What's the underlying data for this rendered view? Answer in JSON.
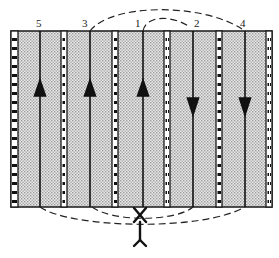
{
  "diagram": {
    "type": "flow-channel schematic",
    "colors": {
      "stroke": "#1a1a1a",
      "fill_pattern": "#b8b8b8",
      "background": "#ffffff"
    },
    "channels": [
      {
        "id": "5",
        "label": "5",
        "x": 40,
        "direction": "up"
      },
      {
        "id": "3",
        "label": "3",
        "x": 90,
        "direction": "up"
      },
      {
        "id": "1",
        "label": "1",
        "x": 143,
        "direction": "up"
      },
      {
        "id": "2",
        "label": "2",
        "x": 193,
        "direction": "down"
      },
      {
        "id": "4",
        "label": "4",
        "x": 245,
        "direction": "down"
      }
    ],
    "top_connections": [
      {
        "from": "1",
        "to": "2"
      },
      {
        "from": "3",
        "to": "4"
      }
    ],
    "bottom_connections": [
      {
        "from": "5",
        "to": "inlet"
      },
      {
        "from": "3",
        "to": "inlet"
      },
      {
        "from": "inlet",
        "to": "2"
      },
      {
        "from": "inlet",
        "to": "4"
      }
    ],
    "inlet": {
      "label": "",
      "symbol": "Y-inlet with crossing"
    }
  }
}
